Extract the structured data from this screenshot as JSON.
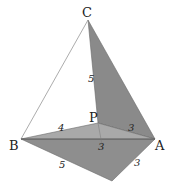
{
  "diagram": {
    "type": "folded-tetrahedron",
    "vertices": {
      "C": {
        "label": "C",
        "x": 88,
        "y": 20
      },
      "P": {
        "label": "P",
        "x": 98,
        "y": 123
      },
      "A": {
        "label": "A",
        "x": 155,
        "y": 139
      },
      "B": {
        "label": "B",
        "x": 21,
        "y": 139
      },
      "D": {
        "label": "",
        "x": 112,
        "y": 181
      }
    },
    "edge_labels": {
      "PC": "5",
      "PB": "4",
      "PA": "3",
      "PD": "3",
      "BD": "5",
      "AD": "3"
    },
    "colors": {
      "face_pca": "#8a8a8a",
      "face_pab": "#a9a9a9",
      "face_abd": "#8e8e8e",
      "edge": "#6a6a6a",
      "thin_edge": "#888888"
    }
  }
}
